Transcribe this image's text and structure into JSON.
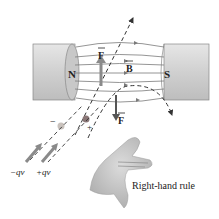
{
  "diagram": {
    "magnet": {
      "north_label": "N",
      "south_label": "S",
      "pole_color": "#d7d7d7",
      "pole_shade": "#b9b9b9"
    },
    "field_label": "B",
    "force_up_label": "F",
    "force_down_label": "F",
    "charges": {
      "negative": {
        "sign": "−",
        "velocity_label": "−qv"
      },
      "positive": {
        "sign": "+",
        "velocity_label": "+qv"
      }
    },
    "hand": {
      "caption": "Right-hand rule"
    },
    "colors": {
      "field_lines": "#7a7a7a",
      "arrows": "#3a3a3a",
      "velocity_arrow": "#8a8a8a",
      "charge_positive": "#8a7676",
      "charge_negative": "#c9c2bd",
      "hand": "#bdbdbd"
    }
  }
}
